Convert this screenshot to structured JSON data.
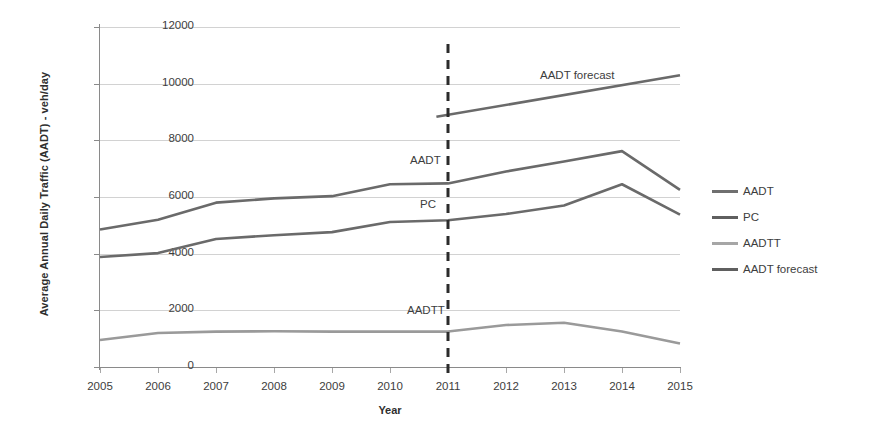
{
  "chart_data": {
    "type": "line",
    "title": "",
    "xlabel": "Year",
    "ylabel": "Average Annual Daily Traffic (AADT) - veh/day",
    "x": [
      2005,
      2006,
      2007,
      2008,
      2009,
      2010,
      2011,
      2012,
      2013,
      2014,
      2015
    ],
    "xticklabels": [
      "2005",
      "2006",
      "2007",
      "2008",
      "2009",
      "2010",
      "2011",
      "2012",
      "2013",
      "2014",
      "2015"
    ],
    "yticklabels": [
      "0",
      "2000",
      "4000",
      "6000",
      "8000",
      "10000",
      "12000"
    ],
    "ylim": [
      0,
      12000
    ],
    "ytick_step": 2000,
    "xlim": [
      2005,
      2015
    ],
    "grid": "horizontal",
    "legend_position": "right",
    "series": [
      {
        "name": "AADT",
        "color": "#6a6a6a",
        "x": [
          2005,
          2006,
          2007,
          2008,
          2009,
          2010,
          2011,
          2012,
          2013,
          2014,
          2015
        ],
        "values": [
          4850,
          5200,
          5800,
          5950,
          6030,
          6450,
          6480,
          6900,
          7250,
          7620,
          6250
        ]
      },
      {
        "name": "PC",
        "color": "#6a6a6a",
        "x": [
          2005,
          2006,
          2007,
          2008,
          2009,
          2010,
          2011,
          2012,
          2013,
          2014,
          2015
        ],
        "values": [
          3880,
          4020,
          4520,
          4650,
          4760,
          5120,
          5180,
          5400,
          5700,
          6450,
          5380
        ]
      },
      {
        "name": "AADTT",
        "color": "#9a9a9a",
        "x": [
          2005,
          2006,
          2007,
          2008,
          2009,
          2010,
          2011,
          2012,
          2013,
          2014,
          2015
        ],
        "values": [
          950,
          1200,
          1250,
          1260,
          1250,
          1250,
          1250,
          1480,
          1560,
          1250,
          830
        ]
      },
      {
        "name": "AADT forecast",
        "color": "#6a6a6a",
        "x": [
          2010.8,
          2015
        ],
        "values": [
          8830,
          10300
        ]
      }
    ],
    "annotations": [
      {
        "text": "AADT forecast",
        "x": 540,
        "y": 70
      },
      {
        "text": "AADT",
        "x": 410,
        "y": 155
      },
      {
        "text": "PC",
        "x": 420,
        "y": 199
      },
      {
        "text": "AADTT",
        "x": 407,
        "y": 305
      }
    ],
    "reference_line": {
      "name": "forecast-divider",
      "x": 2011,
      "style": "dashed",
      "color": "#2b2b2b"
    }
  },
  "legend": {
    "items": [
      {
        "label": "AADT",
        "color": "#6f6f6f"
      },
      {
        "label": "PC",
        "color": "#5f5f5f"
      },
      {
        "label": "AADTT",
        "color": "#a6a6a6"
      },
      {
        "label": "AADT forecast",
        "color": "#5f5f5f"
      }
    ]
  }
}
